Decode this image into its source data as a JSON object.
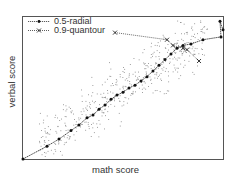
{
  "chart_data": {
    "type": "scatter",
    "title": "",
    "xlabel": "math score",
    "ylabel": "verbal score",
    "grid": false,
    "ticks": false,
    "legend_position": "upper left",
    "xlim": [
      0,
      100
    ],
    "ylim": [
      0,
      100
    ],
    "series": [
      {
        "name": "0.5-radial",
        "style": "line with dot markers",
        "color": "#222222",
        "x": [
          0,
          12,
          18,
          24,
          28,
          32,
          35,
          38,
          41,
          44,
          47,
          50,
          53,
          56,
          59,
          62,
          65,
          68,
          71,
          74,
          77,
          80,
          84,
          90,
          99,
          98.5,
          100
        ],
        "y": [
          0,
          9,
          14,
          20,
          24,
          29,
          31,
          35,
          38,
          42,
          45,
          47,
          50,
          52,
          55,
          58,
          62,
          66,
          70,
          74,
          78,
          80,
          81,
          84,
          86,
          97,
          91
        ]
      },
      {
        "name": "0.9-quantour",
        "style": "dotted line with x markers",
        "color": "#444444",
        "x": [
          46,
          72,
          75,
          80,
          82,
          88
        ],
        "y": [
          89,
          84,
          80,
          78,
          77,
          69
        ]
      },
      {
        "name": "data points",
        "style": "small gray dots",
        "color": "#888888",
        "note": "scattered cloud of ~500 points around diagonal trend"
      }
    ]
  },
  "legend": {
    "items": [
      {
        "label": "0.5-radial",
        "marker": "dot"
      },
      {
        "label": "0.9-quantour",
        "marker": "x"
      }
    ]
  }
}
